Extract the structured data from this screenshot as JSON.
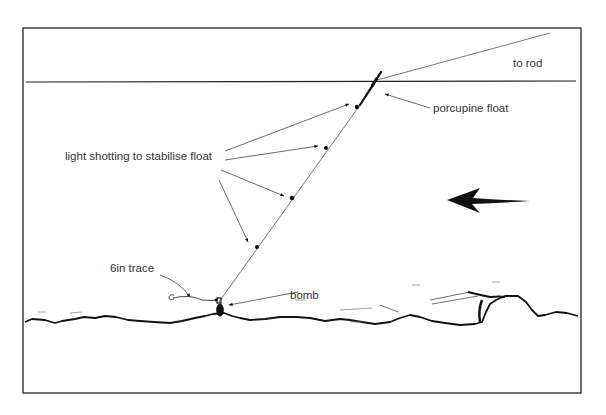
{
  "diagram": {
    "labels": {
      "to_rod": "to rod",
      "porcupine_float": "porcupine float",
      "light_shotting": "light shotting to stabilise float",
      "trace": "6in trace",
      "bomb": "bomb"
    },
    "elements": {
      "water_surface": "surface line",
      "river_bed": "river bed",
      "current_arrow": "current direction (right to left)",
      "shot_count": 4
    },
    "colors": {
      "ink": "#111111",
      "label_text": "#333333",
      "background": "#ffffff"
    }
  }
}
